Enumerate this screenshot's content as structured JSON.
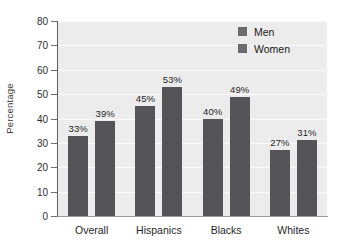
{
  "chart_data": {
    "type": "bar",
    "title": "",
    "subtitle": "",
    "xlabel": "",
    "ylabel": "Percentage",
    "categories": [
      "Overall",
      "Hispanics",
      "Blacks",
      "Whites"
    ],
    "series": [
      {
        "name": "Men",
        "values": [
          33,
          45,
          40,
          27
        ],
        "color": "#555557"
      },
      {
        "name": "Women",
        "values": [
          39,
          53,
          49,
          31
        ],
        "color": "#555557"
      }
    ],
    "data_labels": [
      [
        "33%",
        "45%",
        "40%",
        "27%"
      ],
      [
        "39%",
        "53%",
        "49%",
        "31%"
      ]
    ],
    "ylim": [
      0,
      80
    ],
    "ytick_step": 10,
    "yticks": [
      0,
      10,
      20,
      30,
      40,
      50,
      60,
      70,
      80
    ],
    "ytick_labels": [
      "0",
      "10",
      "20",
      "30",
      "40",
      "50",
      "60",
      "70",
      "80"
    ],
    "grid": true,
    "grid_orientation": "horizontal",
    "grid_color": "#fbfbfb",
    "plot_background": "#ececed",
    "legend_position": "top-right",
    "legend_entries": [
      "Men",
      "Women"
    ],
    "value_label_suffix": "%"
  }
}
